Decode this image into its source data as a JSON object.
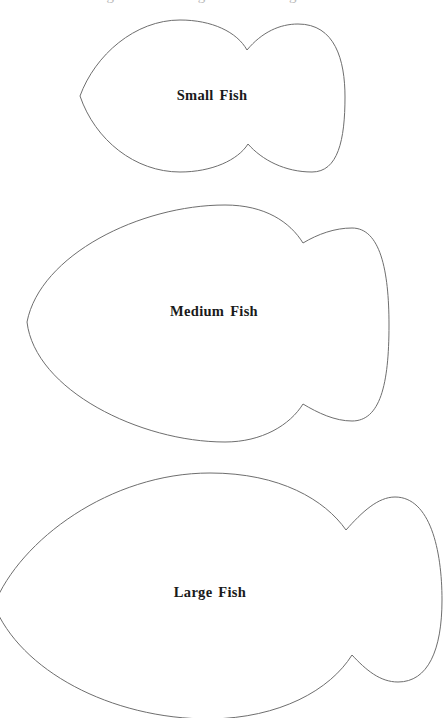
{
  "document": {
    "type": "fish-template-worksheet",
    "top_cutoff_text": "g   g   g"
  },
  "fish": [
    {
      "id": "small",
      "label": "Small Fish",
      "label_center": [
        212,
        95
      ],
      "outline_color": "#6e6e6e"
    },
    {
      "id": "medium",
      "label": "Medium Fish",
      "label_center": [
        214,
        311
      ],
      "outline_color": "#6e6e6e"
    },
    {
      "id": "large",
      "label": "Large Fish",
      "label_center": [
        210,
        592
      ],
      "outline_color": "#6e6e6e"
    }
  ],
  "colors": {
    "background": "#ffffff",
    "outline": "#6e6e6e",
    "label_text": "#1a1a1a"
  }
}
